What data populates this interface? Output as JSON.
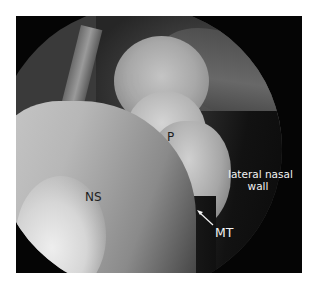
{
  "figure": {
    "type": "endoscopic nasal cavity view",
    "labels": {
      "polyp": "P",
      "nasal_septum": "NS",
      "lateral_wall_line1": "lateral nasal",
      "lateral_wall_line2": "wall",
      "middle_turbinate": "MT"
    },
    "colors": {
      "background": "#ffffff",
      "frame": "#050505",
      "label_dark": "#1e1e1e",
      "label_light": "#f2f2f2"
    }
  }
}
